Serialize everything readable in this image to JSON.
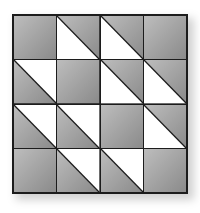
{
  "puzzle": {
    "rows": 4,
    "cols": 4,
    "colors": {
      "gray_light": "#bdbdbd",
      "gray_dark": "#8a8a8a",
      "white": "#ffffff",
      "line": "#1c1c1c"
    },
    "legend": {
      "gray": "solid gray square",
      "split-wb": "diagonal split, white bottom-left, gray top-right",
      "split-wt": "diagonal split, white top-right, gray bottom-left"
    },
    "cells": [
      [
        "gray",
        "split-wb",
        "split-wb",
        "gray"
      ],
      [
        "split-wt",
        "gray",
        "split-wb",
        "split-wb"
      ],
      [
        "split-wt",
        "split-wt",
        "gray",
        "split-wb"
      ],
      [
        "gray",
        "split-wt",
        "split-wt",
        "gray"
      ]
    ]
  }
}
